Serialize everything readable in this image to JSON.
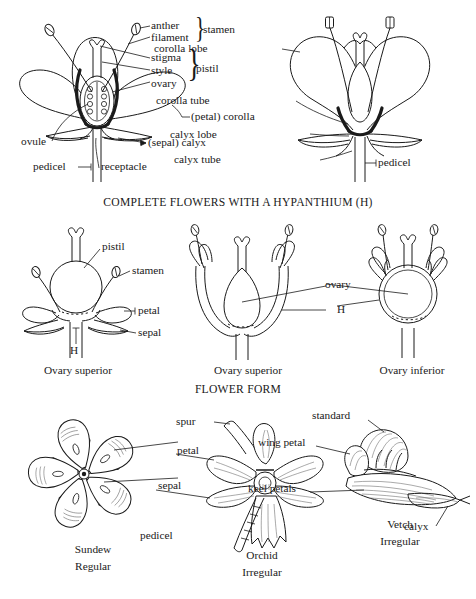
{
  "document": {
    "title": "Flower structure and flower form botanical diagram plate",
    "background_color": "#ffffff",
    "ink_color": "#1a1a1a"
  },
  "headings": [
    {
      "id": "hypanthium",
      "text": "COMPLETE FLOWERS WITH A  HYPANTHIUM (H)"
    },
    {
      "id": "flower-form",
      "text": "FLOWER FORM"
    }
  ],
  "figures": {
    "complete_flower": {
      "caption": "",
      "labels": [
        "anther",
        "filament",
        "stigma",
        "style",
        "ovary",
        "(petal) corolla",
        "ovule",
        "(sepal) calyx",
        "pedicel",
        "receptacle"
      ],
      "brace_groups": [
        {
          "label": "stamen",
          "members": [
            "anther",
            "filament"
          ]
        },
        {
          "label": "pistil",
          "members": [
            "stigma",
            "style",
            "ovary"
          ]
        }
      ]
    },
    "sympetalous_flower": {
      "caption": "",
      "labels": [
        "corolla lobe",
        "corolla tube",
        "calyx lobe",
        "calyx tube",
        "pedicel"
      ]
    },
    "hypanthium_a": {
      "caption": "Ovary superior",
      "labels": [
        "pistil",
        "stamen",
        "petal",
        "sepal",
        "H"
      ]
    },
    "hypanthium_b": {
      "caption": "Ovary superior",
      "labels": [
        "ovary",
        "H"
      ]
    },
    "hypanthium_c": {
      "caption": "Ovary inferior",
      "labels": [
        "ovary",
        "H"
      ]
    },
    "sundew": {
      "caption_name": "Sundew",
      "caption_form": "Regular",
      "labels": [
        "petal",
        "sepal"
      ]
    },
    "orchid": {
      "caption_name": "Orchid",
      "caption_form": "Irregular",
      "labels": [
        "spur",
        "petal",
        "sepal",
        "pedicel"
      ]
    },
    "vetch": {
      "caption_name": "Vetch",
      "caption_form": "Irregular",
      "labels": [
        "standard",
        "wing petal",
        "keel petals",
        "calyx"
      ]
    }
  }
}
